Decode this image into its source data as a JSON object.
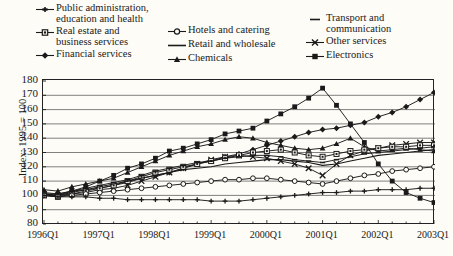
{
  "legend": {
    "columns": [
      {
        "x": 36,
        "y": 2,
        "width": 150,
        "items": [
          {
            "label": "Public administration,\neducation and health",
            "marker": "plus",
            "name": "legend-public-administration"
          },
          {
            "label": "Real estate and\nbusiness services",
            "marker": "square-open",
            "name": "legend-real-estate"
          },
          {
            "label": "Financial services",
            "marker": "diamond",
            "name": "legend-financial-services"
          }
        ]
      },
      {
        "x": 168,
        "y": 24,
        "width": 140,
        "items": [
          {
            "label": "Hotels and catering",
            "marker": "circle",
            "name": "legend-hotels-catering"
          },
          {
            "label": "Retail and wholesale",
            "marker": "line",
            "name": "legend-retail-wholesale"
          },
          {
            "label": "Chemicals",
            "marker": "triangle",
            "name": "legend-chemicals"
          }
        ]
      },
      {
        "x": 306,
        "y": 12,
        "width": 130,
        "items": [
          {
            "label": "Transport and\ncommunication",
            "marker": "dash",
            "name": "legend-transport-communication"
          },
          {
            "label": "Other services",
            "marker": "cross",
            "name": "legend-other-services"
          },
          {
            "label": "Electronics",
            "marker": "square-filled",
            "name": "legend-electronics"
          }
        ]
      }
    ]
  },
  "chart_data": {
    "type": "line",
    "title": "",
    "xlabel": "",
    "ylabel": "Index: 1995 = 100",
    "ylim": [
      80,
      180
    ],
    "yticks": [
      180,
      170,
      160,
      150,
      140,
      130,
      120,
      110,
      100,
      90,
      80
    ],
    "grid": true,
    "legend_position": "top",
    "x": [
      "1996Q1",
      "1996Q2",
      "1996Q3",
      "1996Q4",
      "1997Q1",
      "1997Q2",
      "1997Q3",
      "1997Q4",
      "1998Q1",
      "1998Q2",
      "1998Q3",
      "1998Q4",
      "1999Q1",
      "1999Q2",
      "1999Q3",
      "1999Q4",
      "2000Q1",
      "2000Q2",
      "2000Q3",
      "2000Q4",
      "2001Q1",
      "2001Q2",
      "2001Q3",
      "2001Q4",
      "2002Q1",
      "2002Q2",
      "2002Q3",
      "2002Q4",
      "2003Q1"
    ],
    "xtick_labels": [
      "1996Q1",
      "1997Q1",
      "1998Q1",
      "1999Q1",
      "2000Q1",
      "2001Q1",
      "2002Q1",
      "2003Q1"
    ],
    "xtick_indices": [
      0,
      4,
      8,
      12,
      16,
      20,
      24,
      28
    ],
    "series": [
      {
        "name": "Electronics",
        "marker": "square-filled",
        "values": [
          101,
          100,
          103,
          106,
          110,
          114,
          119,
          122,
          126,
          131,
          133,
          136,
          139,
          143,
          145,
          147,
          152,
          157,
          162,
          168,
          175,
          163,
          150,
          137,
          122,
          110,
          102,
          98,
          95
        ]
      },
      {
        "name": "Financial services",
        "marker": "diamond",
        "values": [
          102,
          101,
          103,
          104,
          105,
          107,
          109,
          112,
          114,
          116,
          119,
          122,
          124,
          127,
          129,
          132,
          135,
          138,
          141,
          144,
          146,
          147,
          149,
          151,
          155,
          158,
          162,
          167,
          172
        ]
      },
      {
        "name": "Chemicals",
        "marker": "triangle",
        "values": [
          104,
          103,
          106,
          108,
          110,
          112,
          116,
          120,
          124,
          128,
          131,
          134,
          136,
          139,
          141,
          140,
          137,
          135,
          133,
          132,
          133,
          136,
          140,
          134,
          131,
          132,
          133,
          132,
          131
        ]
      },
      {
        "name": "Other services",
        "marker": "cross",
        "values": [
          101,
          100,
          101,
          102,
          104,
          105,
          107,
          110,
          113,
          116,
          119,
          122,
          125,
          127,
          128,
          127,
          126,
          124,
          122,
          119,
          114,
          122,
          128,
          131,
          133,
          135,
          136,
          137,
          137
        ]
      },
      {
        "name": "Real estate and business services",
        "marker": "square-open",
        "values": [
          100,
          99,
          101,
          103,
          105,
          107,
          110,
          113,
          116,
          118,
          120,
          122,
          124,
          126,
          128,
          130,
          131,
          132,
          130,
          128,
          127,
          129,
          131,
          132,
          133,
          134,
          134,
          135,
          135
        ]
      },
      {
        "name": "Transport and communication",
        "marker": "dash",
        "values": [
          101,
          101,
          103,
          105,
          107,
          109,
          111,
          114,
          117,
          119,
          121,
          123,
          124,
          126,
          127,
          128,
          128,
          127,
          125,
          124,
          123,
          125,
          127,
          129,
          130,
          131,
          132,
          133,
          134
        ]
      },
      {
        "name": "Retail and wholesale",
        "marker": "line",
        "values": [
          100,
          100,
          102,
          104,
          106,
          108,
          110,
          112,
          114,
          116,
          118,
          119,
          120,
          122,
          123,
          124,
          125,
          125,
          124,
          123,
          121,
          122,
          124,
          126,
          128,
          129,
          130,
          131,
          132
        ]
      },
      {
        "name": "Hotels and catering",
        "marker": "circle",
        "values": [
          100,
          99,
          100,
          101,
          102,
          103,
          104,
          105,
          106,
          107,
          108,
          109,
          110,
          111,
          111,
          112,
          112,
          111,
          110,
          109,
          108,
          110,
          112,
          114,
          115,
          117,
          118,
          119,
          120
        ]
      },
      {
        "name": "Public administration, education and health",
        "marker": "plus",
        "values": [
          100,
          99,
          99,
          99,
          98,
          98,
          97,
          97,
          97,
          97,
          97,
          97,
          96,
          96,
          96,
          97,
          98,
          99,
          100,
          101,
          102,
          102,
          103,
          103,
          104,
          104,
          104,
          105,
          105
        ]
      }
    ]
  }
}
